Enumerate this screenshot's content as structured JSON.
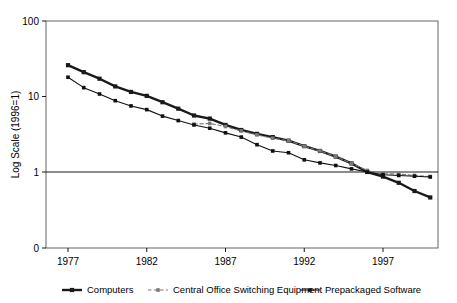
{
  "chart_data": {
    "type": "line",
    "title": "",
    "xlabel": "",
    "ylabel": "Log Scale (1996=1)",
    "yscale": "log",
    "ylim": [
      0.3,
      100
    ],
    "y_ticks": [
      "100",
      "10",
      "1",
      "0"
    ],
    "x_ticks": [
      "1977",
      "1982",
      "1987",
      "1992",
      "1997"
    ],
    "x_tick_values": [
      1977,
      1982,
      1987,
      1992,
      1997
    ],
    "xlim": [
      1977,
      2000
    ],
    "grid": false,
    "legend_position": "bottom",
    "reference_line_y": 1,
    "x": [
      1977,
      1978,
      1979,
      1980,
      1981,
      1982,
      1983,
      1984,
      1985,
      1986,
      1987,
      1988,
      1989,
      1990,
      1991,
      1992,
      1993,
      1994,
      1995,
      1996,
      1997,
      1998,
      1999,
      2000
    ],
    "series": [
      {
        "name": "Computers",
        "marker": "square",
        "color": "#1a1a1a",
        "linestyle": "solid",
        "linewidth": "thick",
        "values": [
          26.0,
          21.0,
          17.2,
          13.6,
          11.5,
          10.2,
          8.4,
          6.9,
          5.6,
          5.1,
          4.2,
          3.6,
          3.2,
          2.9,
          2.6,
          2.2,
          1.9,
          1.6,
          1.3,
          1.0,
          0.87,
          0.72,
          0.56,
          0.46
        ]
      },
      {
        "name": "Central Office Switching Equipment",
        "marker": "square",
        "color": "#7a7a7a",
        "linestyle": "dashed",
        "linewidth": "thin",
        "start_year": 1985,
        "values": [
          null,
          null,
          null,
          null,
          null,
          null,
          null,
          null,
          4.3,
          4.4,
          4.0,
          3.5,
          3.1,
          2.8,
          2.6,
          2.2,
          1.9,
          1.6,
          1.3,
          1.05,
          0.95,
          0.94,
          0.9,
          0.87
        ]
      },
      {
        "name": "Prepackaged Software",
        "marker": "square",
        "color": "#111111",
        "linestyle": "solid",
        "linewidth": "thin",
        "values": [
          18.0,
          13.1,
          10.8,
          8.8,
          7.5,
          6.7,
          5.5,
          4.8,
          4.2,
          3.8,
          3.3,
          2.9,
          2.3,
          1.9,
          1.8,
          1.45,
          1.32,
          1.22,
          1.1,
          1.0,
          0.92,
          0.9,
          0.88,
          0.86
        ]
      }
    ]
  },
  "legend": {
    "items": [
      {
        "label": "Computers"
      },
      {
        "label": "Central Office Switching Equipment"
      },
      {
        "label": "Prepackaged Software"
      }
    ]
  }
}
